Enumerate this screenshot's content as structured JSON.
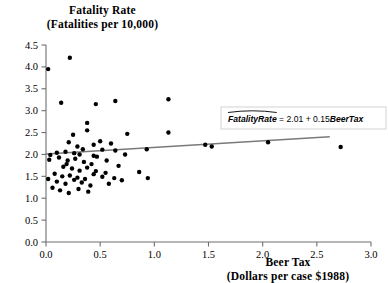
{
  "chart_data": {
    "type": "scatter",
    "title": "",
    "ylabel_line1": "Fatality Rate",
    "ylabel_line2": "(Fatalities per 10,000)",
    "xlabel_line1": "Beer Tax",
    "xlabel_line2": "(Dollars per case $1988)",
    "xlim": [
      0.0,
      3.0
    ],
    "ylim": [
      0.0,
      4.5
    ],
    "xticks": [
      "0.0",
      "0.5",
      "1.0",
      "1.5",
      "2.0",
      "2.5",
      "3.0"
    ],
    "xtick_values": [
      0.0,
      0.5,
      1.0,
      1.5,
      2.0,
      2.5,
      3.0
    ],
    "yticks": [
      "0.0",
      "0.5",
      "1.0",
      "1.5",
      "2.0",
      "2.5",
      "3.0",
      "3.5",
      "4.0",
      "4.5"
    ],
    "ytick_values": [
      0.0,
      0.5,
      1.0,
      1.5,
      2.0,
      2.5,
      3.0,
      3.5,
      4.0,
      4.5
    ],
    "grid": false,
    "legend_position": "none",
    "marker_color": "#000000",
    "line_color": "#7a7a7a",
    "axis_color": "#6e6e6e",
    "annotation": {
      "text_prefix": "FatalityRate",
      "text_middle": " = 2.01 + 0.15",
      "text_suffix": "BeerTax",
      "full_text": "FatalityRate = 2.01 + 0.15BeerTax",
      "has_hat": true,
      "box": true
    },
    "regression": {
      "intercept": 2.01,
      "slope": 0.15,
      "x_start": 0.0,
      "x_end": 2.62
    },
    "points": [
      [
        0.02,
        3.95
      ],
      [
        0.22,
        4.21
      ],
      [
        0.14,
        3.18
      ],
      [
        0.46,
        3.15
      ],
      [
        0.64,
        3.22
      ],
      [
        1.13,
        3.26
      ],
      [
        0.38,
        2.72
      ],
      [
        0.38,
        2.55
      ],
      [
        0.25,
        2.45
      ],
      [
        0.75,
        2.47
      ],
      [
        1.13,
        2.5
      ],
      [
        0.5,
        2.3
      ],
      [
        0.44,
        2.22
      ],
      [
        0.6,
        2.25
      ],
      [
        0.21,
        2.28
      ],
      [
        0.29,
        2.18
      ],
      [
        0.34,
        2.12
      ],
      [
        0.52,
        2.11
      ],
      [
        0.18,
        2.06
      ],
      [
        0.26,
        2.03
      ],
      [
        0.1,
        2.04
      ],
      [
        0.04,
        1.99
      ],
      [
        0.31,
        2.0
      ],
      [
        0.44,
        1.97
      ],
      [
        0.64,
        2.09
      ],
      [
        0.93,
        2.12
      ],
      [
        1.47,
        2.22
      ],
      [
        1.53,
        2.18
      ],
      [
        2.05,
        2.28
      ],
      [
        2.72,
        2.17
      ],
      [
        0.03,
        1.88
      ],
      [
        0.12,
        1.93
      ],
      [
        0.2,
        1.86
      ],
      [
        0.27,
        1.9
      ],
      [
        0.35,
        1.83
      ],
      [
        0.42,
        1.78
      ],
      [
        0.16,
        1.72
      ],
      [
        0.24,
        1.68
      ],
      [
        0.31,
        1.63
      ],
      [
        0.38,
        1.7
      ],
      [
        0.46,
        1.62
      ],
      [
        0.55,
        1.58
      ],
      [
        0.08,
        1.56
      ],
      [
        0.15,
        1.5
      ],
      [
        0.22,
        1.52
      ],
      [
        0.29,
        1.47
      ],
      [
        0.36,
        1.44
      ],
      [
        0.44,
        1.55
      ],
      [
        0.52,
        1.49
      ],
      [
        0.63,
        1.46
      ],
      [
        0.02,
        1.44
      ],
      [
        0.1,
        1.38
      ],
      [
        0.18,
        1.33
      ],
      [
        0.26,
        1.42
      ],
      [
        0.33,
        1.36
      ],
      [
        0.41,
        1.29
      ],
      [
        0.86,
        1.6
      ],
      [
        0.94,
        1.46
      ],
      [
        0.06,
        1.24
      ],
      [
        0.13,
        1.18
      ],
      [
        0.21,
        1.12
      ],
      [
        0.3,
        1.21
      ],
      [
        0.39,
        1.15
      ],
      [
        0.58,
        1.33
      ],
      [
        0.7,
        1.41
      ],
      [
        0.47,
        1.95
      ],
      [
        0.56,
        1.86
      ],
      [
        0.67,
        1.74
      ],
      [
        0.73,
        2.0
      ],
      [
        0.19,
        1.78
      ]
    ]
  }
}
